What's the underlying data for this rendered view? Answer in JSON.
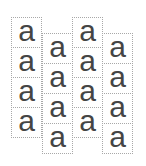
{
  "layout": {
    "description": "Four staggered columns of dotted-border boxes, each containing the letter 'a'",
    "border_color": "#a8a8a8",
    "glyph_color": "#454545"
  },
  "columns": [
    {
      "cells": [
        {
          "text": "a"
        },
        {
          "text": "a"
        },
        {
          "text": "a"
        },
        {
          "text": "a"
        }
      ]
    },
    {
      "cells": [
        {
          "text": "a"
        },
        {
          "text": "a"
        },
        {
          "text": "a"
        },
        {
          "text": "a"
        }
      ]
    },
    {
      "cells": [
        {
          "text": "a"
        },
        {
          "text": "a"
        },
        {
          "text": "a"
        },
        {
          "text": "a"
        }
      ]
    },
    {
      "cells": [
        {
          "text": "a"
        },
        {
          "text": "a"
        },
        {
          "text": "a"
        },
        {
          "text": "a"
        }
      ]
    }
  ]
}
